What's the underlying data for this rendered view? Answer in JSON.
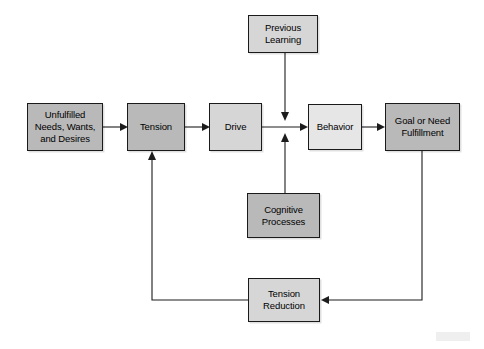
{
  "diagram": {
    "type": "flowchart",
    "background_color": "#ffffff",
    "line_color": "#1c1c1c",
    "nodes": [
      {
        "id": "unfulfilled",
        "label": "Unfulfilled\nNeeds, Wants,\nand Desires",
        "fill": "#b9b9b9",
        "shade": "dark"
      },
      {
        "id": "tension",
        "label": "Tension",
        "fill": "#b9b9b9",
        "shade": "dark"
      },
      {
        "id": "drive",
        "label": "Drive",
        "fill": "#d6d6d6",
        "shade": "mid"
      },
      {
        "id": "behavior",
        "label": "Behavior",
        "fill": "#e6e6e6",
        "shade": "light"
      },
      {
        "id": "goal",
        "label": "Goal or Need\nFulfillment",
        "fill": "#b9b9b9",
        "shade": "dark"
      },
      {
        "id": "previous_learning",
        "label": "Previous\nLearning",
        "fill": "#d6d6d6",
        "shade": "mid"
      },
      {
        "id": "cognitive_processes",
        "label": "Cognitive\nProcesses",
        "fill": "#b9b9b9",
        "shade": "dark"
      },
      {
        "id": "tension_reduction",
        "label": "Tension\nReduction",
        "fill": "#d6d6d6",
        "shade": "mid"
      }
    ],
    "edges": [
      {
        "from": "unfulfilled",
        "to": "tension",
        "style": "straight-arrow"
      },
      {
        "from": "tension",
        "to": "drive",
        "style": "straight-arrow"
      },
      {
        "from": "drive",
        "to": "behavior",
        "style": "straight-arrow"
      },
      {
        "from": "previous_learning",
        "to": "behavior",
        "style": "down-arrow-to-junction"
      },
      {
        "from": "cognitive_processes",
        "to": "behavior",
        "style": "up-arrow-to-junction"
      },
      {
        "from": "behavior",
        "to": "goal",
        "style": "straight-arrow"
      },
      {
        "from": "goal",
        "to": "tension_reduction",
        "style": "feedback-down-left"
      },
      {
        "from": "tension_reduction",
        "to": "tension",
        "style": "feedback-left-up"
      }
    ]
  }
}
